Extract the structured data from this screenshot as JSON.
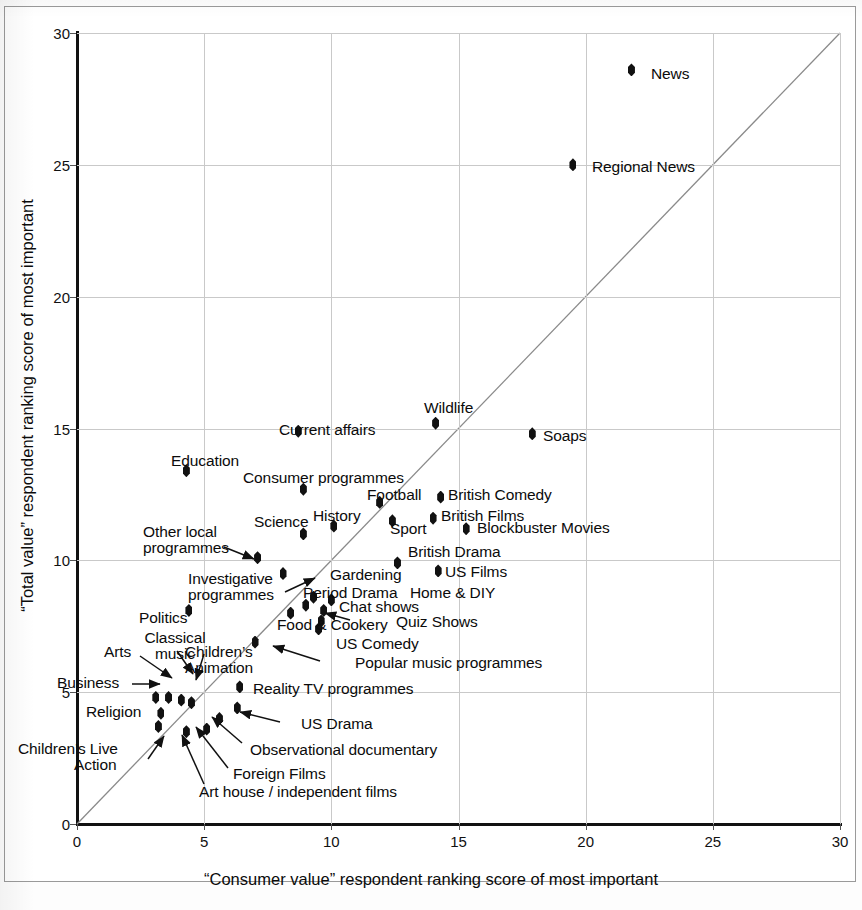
{
  "chart_data": {
    "type": "scatter",
    "title": "",
    "xlabel": "“Consumer value” respondent ranking score of most important",
    "ylabel": "“Total value” respondent ranking score of most important",
    "xlim": [
      0,
      30
    ],
    "ylim": [
      0,
      30
    ],
    "xticks": [
      "0",
      "5",
      "10",
      "15",
      "20",
      "25",
      "30"
    ],
    "yticks": [
      "0",
      "5",
      "10",
      "15",
      "20",
      "25",
      "30"
    ],
    "grid": true,
    "legend": "none",
    "annotations": [
      "Diagonal 45-degree reference line y = x"
    ],
    "points": [
      {
        "label": "News",
        "x": 21.8,
        "y": 28.6,
        "label_pos": "right"
      },
      {
        "label": "Regional News",
        "x": 19.5,
        "y": 25.0,
        "label_pos": "right"
      },
      {
        "label": "Wildlife",
        "x": 14.1,
        "y": 15.2,
        "label_pos": "above"
      },
      {
        "label": "Soaps",
        "x": 17.9,
        "y": 14.8,
        "label_pos": "right"
      },
      {
        "label": "Current affairs",
        "x": 8.7,
        "y": 14.9,
        "label_pos": "above"
      },
      {
        "label": "Education",
        "x": 4.3,
        "y": 13.4,
        "label_pos": "above"
      },
      {
        "label": "Consumer programmes",
        "x": 8.9,
        "y": 12.7,
        "label_pos": "above"
      },
      {
        "label": "Football",
        "x": 11.9,
        "y": 12.2,
        "label_pos": "above"
      },
      {
        "label": "British Comedy",
        "x": 14.3,
        "y": 12.4,
        "label_pos": "right"
      },
      {
        "label": "British Films",
        "x": 14.0,
        "y": 11.6,
        "label_pos": "right"
      },
      {
        "label": "Blockbuster Movies",
        "x": 15.3,
        "y": 11.2,
        "label_pos": "right"
      },
      {
        "label": "Sport",
        "x": 12.4,
        "y": 11.5,
        "label_pos": "right"
      },
      {
        "label": "History",
        "x": 10.1,
        "y": 11.3,
        "label_pos": "above"
      },
      {
        "label": "Science",
        "x": 8.9,
        "y": 11.0,
        "label_pos": "above"
      },
      {
        "label": "Other local programmes",
        "x": 7.1,
        "y": 10.1,
        "label_pos": "arrow"
      },
      {
        "label": "British Drama",
        "x": 12.6,
        "y": 9.9,
        "label_pos": "above"
      },
      {
        "label": "US Films",
        "x": 14.2,
        "y": 9.6,
        "label_pos": "right"
      },
      {
        "label": "Investigative programmes",
        "x": 8.1,
        "y": 9.5,
        "label_pos": "arrow"
      },
      {
        "label": "Gardening",
        "x": 9.3,
        "y": 8.6,
        "label_pos": "above"
      },
      {
        "label": "Period Drama",
        "x": 9.0,
        "y": 8.3,
        "label_pos": "above"
      },
      {
        "label": "Home & DIY",
        "x": 10.0,
        "y": 8.5,
        "label_pos": "right"
      },
      {
        "label": "Chat shows",
        "x": 9.7,
        "y": 8.1,
        "label_pos": "right"
      },
      {
        "label": "Quiz Shows",
        "x": 9.6,
        "y": 7.7,
        "label_pos": "arrow"
      },
      {
        "label": "Food & Cookery",
        "x": 8.4,
        "y": 8.0,
        "label_pos": "below"
      },
      {
        "label": "US Comedy",
        "x": 9.5,
        "y": 7.4,
        "label_pos": "right"
      },
      {
        "label": "Politics",
        "x": 4.4,
        "y": 8.1,
        "label_pos": "left"
      },
      {
        "label": "Popular music programmes",
        "x": 7.0,
        "y": 6.9,
        "label_pos": "arrow"
      },
      {
        "label": "Reality TV programmes",
        "x": 6.4,
        "y": 5.2,
        "label_pos": "right"
      },
      {
        "label": "Arts",
        "x": 3.6,
        "y": 4.8,
        "label_pos": "arrow"
      },
      {
        "label": "Classical music",
        "x": 4.1,
        "y": 4.7,
        "label_pos": "arrow"
      },
      {
        "label": "Children's Animation",
        "x": 4.5,
        "y": 4.6,
        "label_pos": "arrow"
      },
      {
        "label": "Business",
        "x": 3.1,
        "y": 4.8,
        "label_pos": "arrow"
      },
      {
        "label": "Religion",
        "x": 3.3,
        "y": 4.2,
        "label_pos": "left"
      },
      {
        "label": "US Drama",
        "x": 6.3,
        "y": 4.4,
        "label_pos": "arrow"
      },
      {
        "label": "Children's Live Action",
        "x": 3.2,
        "y": 3.7,
        "label_pos": "arrow"
      },
      {
        "label": "Observational documentary",
        "x": 5.6,
        "y": 4.0,
        "label_pos": "arrow"
      },
      {
        "label": "Foreign Films",
        "x": 5.1,
        "y": 3.6,
        "label_pos": "arrow"
      },
      {
        "label": "Art house / independent films",
        "x": 4.3,
        "y": 3.5,
        "label_pos": "arrow"
      }
    ]
  },
  "axes": {
    "x_label": "“Consumer value” respondent ranking score of most important",
    "y_label": "“Total value” respondent ranking score of most important",
    "x_ticks": [
      "0",
      "5",
      "10",
      "15",
      "20",
      "25",
      "30"
    ],
    "y_ticks": [
      "0",
      "5",
      "10",
      "15",
      "20",
      "25",
      "30"
    ]
  },
  "labels": {
    "news": "News",
    "regional_news": "Regional News",
    "wildlife": "Wildlife",
    "soaps": "Soaps",
    "current_affairs": "Current affairs",
    "education": "Education",
    "consumer_programmes": "Consumer programmes",
    "football": "Football",
    "british_comedy": "British Comedy",
    "british_films": "British Films",
    "blockbuster_movies": "Blockbuster Movies",
    "sport": "Sport",
    "history": "History",
    "science": "Science",
    "other_local_1": "Other local",
    "other_local_2": "programmes",
    "british_drama": "British Drama",
    "us_films": "US Films",
    "investigative_1": "Investigative",
    "investigative_2": "programmes",
    "gardening": "Gardening",
    "period_drama": "Period Drama",
    "home_diy": "Home & DIY",
    "chat_shows": "Chat shows",
    "quiz_shows": "Quiz Shows",
    "food_cookery": "Food & Cookery",
    "us_comedy": "US Comedy",
    "politics": "Politics",
    "popular_music": "Popular music programmes",
    "reality_tv": "Reality TV programmes",
    "arts": "Arts",
    "classical_1": "Classical",
    "classical_2": "music",
    "childrens_anim_1": "Children’s",
    "childrens_anim_2": "Animation",
    "business": "Business",
    "religion": "Religion",
    "us_drama": "US Drama",
    "childrens_live_1": "Children’s Live",
    "childrens_live_2": "Action",
    "observational": "Observational documentary",
    "foreign_films": "Foreign Films",
    "art_house": "Art house / independent films"
  },
  "colors": {
    "marker": "#111111",
    "grid": "#c9c9c9",
    "axis": "#111111",
    "diagonal": "#8a8a8a",
    "page_border": "#9a9a9a"
  },
  "margin_note": "scanned page artifact handwriting"
}
